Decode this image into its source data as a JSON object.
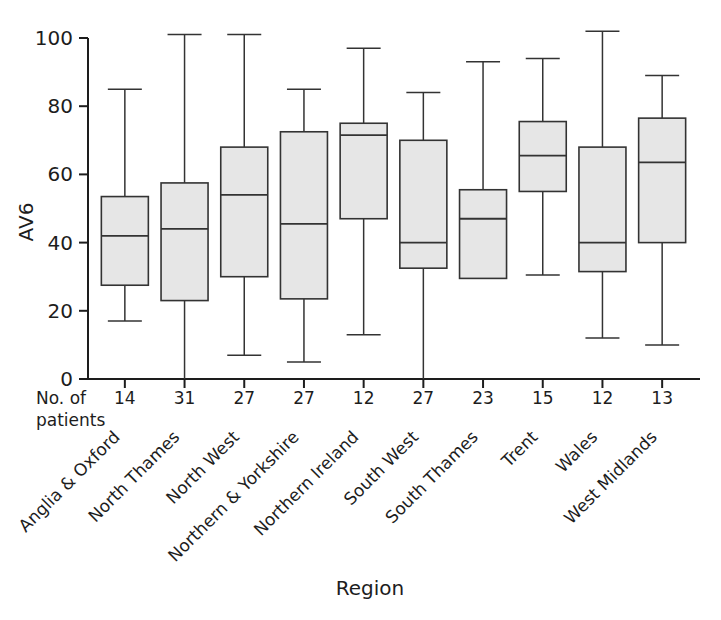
{
  "chart_data": {
    "type": "box",
    "title": "",
    "xlabel": "Region",
    "ylabel": "AV6",
    "ylim": [
      0,
      100
    ],
    "yticks": [
      0,
      20,
      40,
      60,
      80,
      100
    ],
    "ytick_labels": [
      "0",
      "20",
      "40",
      "60",
      "80",
      "100"
    ],
    "grid": false,
    "legend": "none",
    "secondary_axis_label_line1": "No. of",
    "secondary_axis_label_line2": "patients",
    "categories": [
      "Anglia & Oxford",
      "North Thames",
      "North West",
      "Northern & Yorkshire",
      "Northern Ireland",
      "South West",
      "South Thames",
      "Trent",
      "Wales",
      "West Midlands"
    ],
    "counts": [
      14,
      31,
      27,
      27,
      12,
      27,
      23,
      15,
      12,
      13
    ],
    "boxes": [
      {
        "category": "Anglia & Oxford",
        "whisker_low": 17,
        "q1": 27.5,
        "median": 42,
        "q3": 53.5,
        "whisker_high": 85
      },
      {
        "category": "North Thames",
        "whisker_low": 0,
        "q1": 23,
        "median": 44,
        "q3": 57.5,
        "whisker_high": 101
      },
      {
        "category": "North West",
        "whisker_low": 7,
        "q1": 30,
        "median": 54,
        "q3": 68,
        "whisker_high": 101
      },
      {
        "category": "Northern & Yorkshire",
        "whisker_low": 5,
        "q1": 23.5,
        "median": 45.5,
        "q3": 72.5,
        "whisker_high": 85
      },
      {
        "category": "Northern Ireland",
        "whisker_low": 13,
        "q1": 47,
        "median": 71.5,
        "q3": 75,
        "whisker_high": 97
      },
      {
        "category": "South West",
        "whisker_low": 0,
        "q1": 32.5,
        "median": 40,
        "q3": 70,
        "whisker_high": 84
      },
      {
        "category": "South Thames",
        "whisker_low": 30,
        "q1": 29.5,
        "median": 47,
        "q3": 55.5,
        "whisker_high": 93
      },
      {
        "category": "Trent",
        "whisker_low": 30.5,
        "q1": 55,
        "median": 65.5,
        "q3": 75.5,
        "whisker_high": 94
      },
      {
        "category": "Wales",
        "whisker_low": 12,
        "q1": 31.5,
        "median": 40,
        "q3": 68,
        "whisker_high": 102
      },
      {
        "category": "West Midlands",
        "whisker_low": 10,
        "q1": 40,
        "median": 63.5,
        "q3": 76.5,
        "whisker_high": 89
      }
    ],
    "colors": {
      "box_fill": "#e6e6e6",
      "box_stroke": "#333333",
      "axis": "#1d1d1d",
      "background": "#ffffff"
    }
  }
}
